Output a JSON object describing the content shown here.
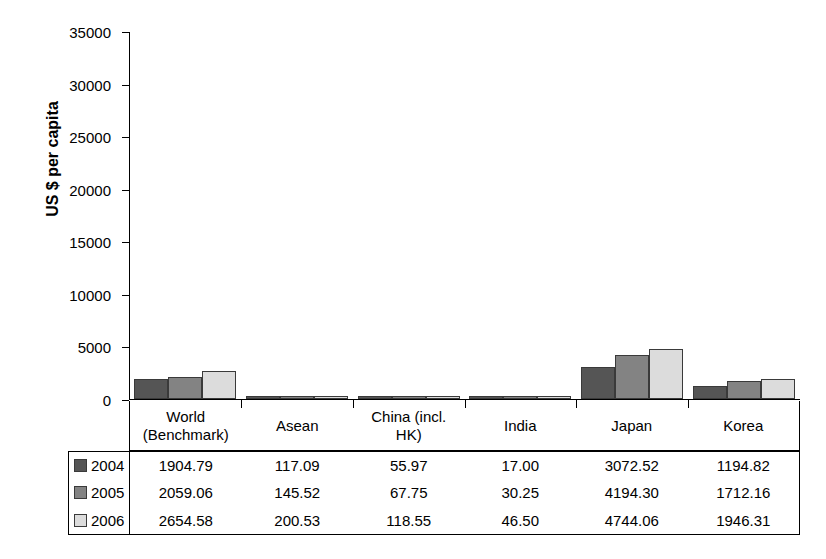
{
  "chart_data": {
    "type": "bar",
    "title": "",
    "xlabel": "",
    "ylabel": "US $ per capita",
    "ylim": [
      0,
      35000
    ],
    "ytick_labels": [
      "35000",
      "30000",
      "25000",
      "20000",
      "15000",
      "10000",
      "5000",
      "0"
    ],
    "ytick_values": [
      35000,
      30000,
      25000,
      20000,
      15000,
      10000,
      5000,
      0
    ],
    "grid": false,
    "legend_position": "table-row-labels",
    "categories": [
      "World (Benchmark)",
      "Asean",
      "China (incl. HK)",
      "India",
      "Japan",
      "Korea"
    ],
    "category_lines": [
      [
        "World",
        "(Benchmark)"
      ],
      [
        "Asean"
      ],
      [
        "China (incl.",
        "HK)"
      ],
      [
        "India"
      ],
      [
        "Japan"
      ],
      [
        "Korea"
      ]
    ],
    "series": [
      {
        "name": "2004",
        "color": "#555555",
        "values": [
          1904.79,
          117.09,
          55.97,
          17.0,
          3072.52,
          1194.82
        ],
        "labels": [
          "1904.79",
          "117.09",
          "55.97",
          "17.00",
          "3072.52",
          "1194.82"
        ]
      },
      {
        "name": "2005",
        "color": "#838383",
        "values": [
          2059.06,
          145.52,
          67.75,
          30.25,
          4194.3,
          1712.16
        ],
        "labels": [
          "2059.06",
          "145.52",
          "67.75",
          "30.25",
          "4194.30",
          "1712.16"
        ]
      },
      {
        "name": "2006",
        "color": "#dcdcdc",
        "values": [
          2654.58,
          200.53,
          118.55,
          46.5,
          4744.06,
          1946.31
        ],
        "labels": [
          "2654.58",
          "200.53",
          "118.55",
          "46.50",
          "4744.06",
          "1946.31"
        ]
      }
    ]
  }
}
